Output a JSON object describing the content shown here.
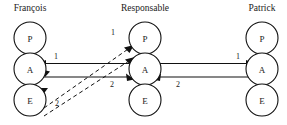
{
  "diagram": {
    "type": "actor-interaction-diagram",
    "columns": [
      {
        "id": "francois",
        "title": "François",
        "title_x": 30,
        "nodes": [
          {
            "id": "francois-p",
            "label": "P",
            "cx": 30,
            "cy": 38
          },
          {
            "id": "francois-a",
            "label": "A",
            "cx": 30,
            "cy": 69
          },
          {
            "id": "francois-e",
            "label": "E",
            "cx": 30,
            "cy": 100
          }
        ]
      },
      {
        "id": "responsable",
        "title": "Responsable",
        "title_x": 145,
        "nodes": [
          {
            "id": "responsable-p",
            "label": "P",
            "cx": 145,
            "cy": 38
          },
          {
            "id": "responsable-a",
            "label": "A",
            "cx": 145,
            "cy": 69
          },
          {
            "id": "responsable-e",
            "label": "E",
            "cx": 145,
            "cy": 100
          }
        ]
      },
      {
        "id": "patrick",
        "title": "Patrick",
        "title_x": 262,
        "nodes": [
          {
            "id": "patrick-p",
            "label": "P",
            "cx": 262,
            "cy": 38
          },
          {
            "id": "patrick-a",
            "label": "A",
            "cx": 262,
            "cy": 69
          },
          {
            "id": "patrick-e",
            "label": "E",
            "cx": 262,
            "cy": 100
          }
        ]
      }
    ],
    "node_radius": 16,
    "edges": [
      {
        "id": "edge-resp-a-to-francois-a",
        "style": "solid",
        "label": "1",
        "label_x": 56,
        "label_y": 59,
        "from": "responsable-a",
        "to": "francois-a",
        "direction": "left"
      },
      {
        "id": "edge-francois-a-to-resp-a",
        "style": "solid",
        "label": "2",
        "label_x": 112,
        "label_y": 87,
        "from": "francois-a",
        "to": "responsable-a",
        "direction": "right"
      },
      {
        "id": "edge-resp-a-to-patrick-a",
        "style": "solid",
        "label": "1",
        "label_x": 238,
        "label_y": 59,
        "from": "responsable-a",
        "to": "patrick-a",
        "direction": "right"
      },
      {
        "id": "edge-patrick-a-to-resp-a",
        "style": "solid",
        "label": "2",
        "label_x": 178,
        "label_y": 87,
        "from": "patrick-a",
        "to": "responsable-a",
        "direction": "left"
      },
      {
        "id": "edge-francois-e-to-resp-p",
        "style": "dashed",
        "label": "1",
        "label_x": 113,
        "label_y": 35,
        "from": "francois-e",
        "to": "responsable-p",
        "direction": "upright"
      },
      {
        "id": "edge-francois-e-to-resp-a",
        "style": "dashed",
        "label": "2",
        "label_x": 57,
        "label_y": 106,
        "from": "francois-e",
        "to": "responsable-a",
        "direction": "upright"
      }
    ],
    "colors": {
      "background": "#ffffff",
      "stroke": "#111111",
      "text": "#1a1a1a"
    }
  }
}
